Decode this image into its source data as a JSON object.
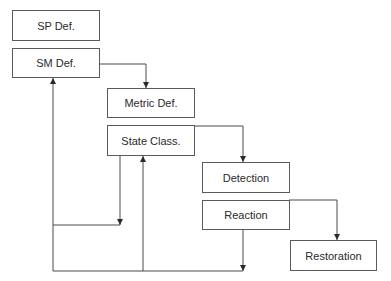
{
  "diagram": {
    "type": "flowchart",
    "nodes": [
      {
        "id": "sp_def",
        "label": "SP Def."
      },
      {
        "id": "sm_def",
        "label": "SM Def."
      },
      {
        "id": "metric_def",
        "label": "Metric Def."
      },
      {
        "id": "state_class",
        "label": "State Class."
      },
      {
        "id": "detection",
        "label": "Detection"
      },
      {
        "id": "reaction",
        "label": "Reaction"
      },
      {
        "id": "restoration",
        "label": "Restoration"
      }
    ],
    "edges": [
      {
        "from": "sm_def",
        "to": "metric_def"
      },
      {
        "from": "state_class",
        "to": "detection"
      },
      {
        "from": "reaction",
        "to": "restoration"
      },
      {
        "from": "state_class",
        "to": "sm_def",
        "note": "feedback loop"
      },
      {
        "from": "reaction",
        "to": "sm_def",
        "note": "feedback loop"
      },
      {
        "from": "reaction",
        "to": "state_class",
        "note": "feedback loop"
      }
    ],
    "colors": {
      "line": "#3a3a3a",
      "border": "#5a5a5a",
      "text": "#2a2a2a"
    }
  }
}
